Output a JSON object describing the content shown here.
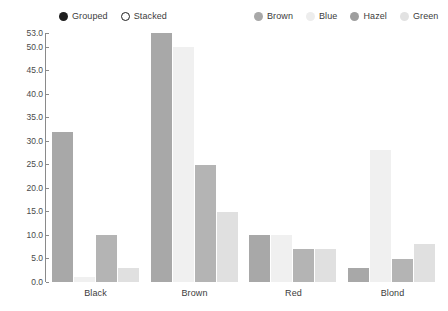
{
  "chart_data": {
    "type": "bar",
    "title": "",
    "xlabel": "",
    "ylabel": "",
    "categories": [
      "Black",
      "Brown",
      "Red",
      "Blond"
    ],
    "series": [
      {
        "name": "Brown",
        "color": "#a8a8a8",
        "values": [
          32,
          53,
          10,
          3
        ]
      },
      {
        "name": "Blue",
        "color": "#f0f0f0",
        "values": [
          1,
          50,
          10,
          28
        ]
      },
      {
        "name": "Hazel",
        "color": "#b4b4b4",
        "values": [
          10,
          25,
          7,
          5
        ]
      },
      {
        "name": "Green",
        "color": "#e0e0e0",
        "values": [
          3,
          15,
          7,
          8
        ]
      }
    ],
    "ylim": [
      0,
      53
    ],
    "yticks": [
      "0.0",
      "5.0",
      "10.0",
      "15.0",
      "20.0",
      "25.0",
      "30.0",
      "35.0",
      "40.0",
      "45.0",
      "50.0",
      "53.0"
    ],
    "ytick_values": [
      0,
      5,
      10,
      15,
      20,
      25,
      30,
      35,
      40,
      45,
      50,
      53
    ],
    "grid": false,
    "legend_position": "top"
  },
  "legends": {
    "mode": {
      "entries": [
        {
          "label": "Grouped",
          "marker": "filled",
          "color": "#1f1f1f"
        },
        {
          "label": "Stacked",
          "marker": "hollow",
          "color": "#ffffff"
        }
      ]
    },
    "series": {
      "entries": [
        {
          "label": "Brown",
          "marker": "filled",
          "color": "#a8a8a8"
        },
        {
          "label": "Blue",
          "marker": "filled",
          "color": "#ededed"
        },
        {
          "label": "Hazel",
          "marker": "filled",
          "color": "#9e9e9e"
        },
        {
          "label": "Green",
          "marker": "filled",
          "color": "#e2e2e2"
        }
      ]
    }
  }
}
